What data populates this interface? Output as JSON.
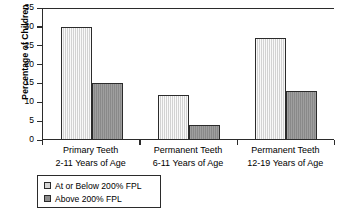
{
  "chart_data": {
    "type": "bar",
    "title": "",
    "xlabel": "",
    "ylabel": "Percentage of Children",
    "ylim": [
      0,
      35
    ],
    "yticks": [
      0,
      5,
      10,
      15,
      20,
      25,
      30,
      35
    ],
    "grid": false,
    "legend_position": "bottom-left",
    "categories": [
      "Primary Teeth\n2-11 Years of Age",
      "Permanent Teeth\n6-11 Years of Age",
      "Permanent Teeth\n12-19 Years of Age"
    ],
    "category_lines": [
      {
        "line1": "Primary Teeth",
        "line2": "2-11 Years of Age"
      },
      {
        "line1": "Permanent Teeth",
        "line2": "6-11 Years of Age"
      },
      {
        "line1": "Permanent Teeth",
        "line2": "12-19 Years of Age"
      }
    ],
    "series": [
      {
        "name": "At or Below 200% FPL",
        "color": "#d6d6d6",
        "values": [
          30,
          12,
          27
        ]
      },
      {
        "name": "Above 200% FPL",
        "color": "#8d8d8d",
        "values": [
          15,
          4,
          13
        ]
      }
    ]
  },
  "legend": {
    "items": [
      {
        "label": "At or Below 200% FPL",
        "color": "#d6d6d6"
      },
      {
        "label": "Above 200% FPL",
        "color": "#8d8d8d"
      }
    ]
  },
  "axis": {
    "y_title": "Percentage of Children",
    "y_tick_labels": [
      "35",
      "30",
      "25",
      "20",
      "15",
      "10",
      "5",
      "0"
    ]
  },
  "colors": {
    "axis": "#2b2b2b",
    "background": "#ffffff",
    "series_light": "#d6d6d6",
    "series_dark": "#8d8d8d"
  }
}
